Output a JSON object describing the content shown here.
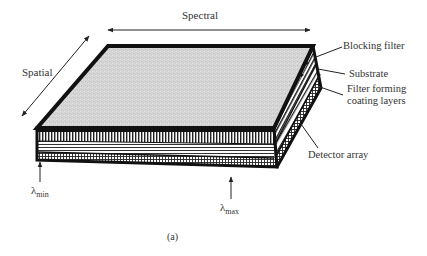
{
  "diagram": {
    "type": "layered-filter-detector-schematic",
    "axes": {
      "spectral_label": "Spectral",
      "spatial_label": "Spatial"
    },
    "callouts": {
      "blocking_filter": "Blocking filter",
      "substrate": "Substrate",
      "filter_coating_line1": "Filter forming",
      "filter_coating_line2": "coating layers",
      "detector_array": "Detector array"
    },
    "wavelength_markers": {
      "min_symbol": "λ",
      "min_sub": "min",
      "max_symbol": "λ",
      "max_sub": "max"
    },
    "caption": "(a)",
    "colors": {
      "outline": "#111111",
      "top_face": "#d4d4d4",
      "background": "#ffffff",
      "text": "#333333"
    }
  }
}
